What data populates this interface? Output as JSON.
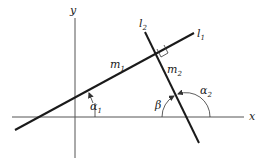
{
  "diagram": {
    "title": "",
    "axes": {
      "x_label": "x",
      "y_label": "y"
    },
    "lines": [
      {
        "id": "l1",
        "label": "l",
        "subscript": "1",
        "slope_label": "m",
        "slope_subscript": "1",
        "angle_label": "α",
        "angle_subscript": "1"
      },
      {
        "id": "l2",
        "label": "l",
        "subscript": "2",
        "slope_label": "m",
        "slope_subscript": "2",
        "angle_label": "α",
        "angle_subscript": "2"
      }
    ],
    "extra_angle": {
      "label": "β"
    },
    "relation": "perpendicular",
    "colors": {
      "lines": "#1a1a1a",
      "axes": "#555555",
      "background": "#ffffff"
    }
  }
}
